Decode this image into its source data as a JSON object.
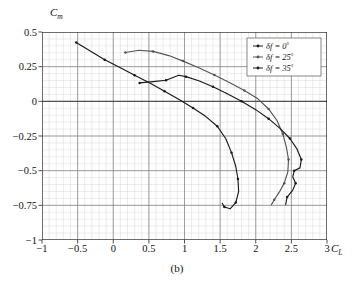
{
  "chart_data": {
    "type": "line",
    "title": "",
    "caption": "(b)",
    "xlabel": "C_L",
    "xlabel_main": "C",
    "xlabel_sub": "L",
    "ylabel": "C_m",
    "ylabel_main": "C",
    "ylabel_sub": "m",
    "xlim": [
      -1,
      3
    ],
    "ylim": [
      -1,
      0.5
    ],
    "xticks": [
      -1,
      -0.5,
      0,
      0.5,
      1,
      1.5,
      2,
      2.5,
      3
    ],
    "xtick_labels": [
      "-1",
      "-0.5",
      "0",
      "0.5",
      "1",
      "1.5",
      "2",
      "2.5",
      "3"
    ],
    "yticks": [
      0.5,
      0.25,
      0,
      -0.25,
      -0.5,
      -0.75,
      -1
    ],
    "ytick_labels": [
      "0.5",
      "0.25",
      "0",
      "-0.25",
      "-0.5",
      "-0.75",
      "-1"
    ],
    "grid": true,
    "grid_major_x": 0.5,
    "grid_major_y": 0.25,
    "grid_minor_x": 0.1,
    "grid_minor_y": 0.05,
    "legend_position": "top-right",
    "series": [
      {
        "name": "df = 0",
        "label_symbol": "δf",
        "label_value": "0",
        "label_unit": "°",
        "color": "#1a1a1a",
        "points": [
          [
            -0.52,
            0.425
          ],
          [
            -0.3,
            0.355
          ],
          [
            -0.12,
            0.3
          ],
          [
            0.1,
            0.243
          ],
          [
            0.3,
            0.188
          ],
          [
            0.52,
            0.13
          ],
          [
            0.72,
            0.072
          ],
          [
            0.93,
            0.012
          ],
          [
            1.12,
            -0.048
          ],
          [
            1.3,
            -0.11
          ],
          [
            1.46,
            -0.18
          ],
          [
            1.58,
            -0.27
          ],
          [
            1.66,
            -0.37
          ],
          [
            1.72,
            -0.47
          ],
          [
            1.75,
            -0.56
          ],
          [
            1.76,
            -0.65
          ],
          [
            1.72,
            -0.73
          ],
          [
            1.64,
            -0.775
          ],
          [
            1.56,
            -0.762
          ],
          [
            1.53,
            -0.735
          ]
        ]
      },
      {
        "name": "df = 25",
        "label_symbol": "δf",
        "label_value": "25",
        "label_unit": "°",
        "color": "#555555",
        "points": [
          [
            0.17,
            0.352
          ],
          [
            0.36,
            0.368
          ],
          [
            0.56,
            0.36
          ],
          [
            0.78,
            0.33
          ],
          [
            0.98,
            0.29
          ],
          [
            1.2,
            0.242
          ],
          [
            1.42,
            0.19
          ],
          [
            1.63,
            0.135
          ],
          [
            1.84,
            0.078
          ],
          [
            2.03,
            0.018
          ],
          [
            2.18,
            -0.055
          ],
          [
            2.3,
            -0.14
          ],
          [
            2.38,
            -0.235
          ],
          [
            2.43,
            -0.33
          ],
          [
            2.46,
            -0.42
          ],
          [
            2.45,
            -0.51
          ],
          [
            2.4,
            -0.59
          ],
          [
            2.33,
            -0.655
          ],
          [
            2.26,
            -0.71
          ],
          [
            2.22,
            -0.745
          ]
        ]
      },
      {
        "name": "df = 35",
        "label_symbol": "δf",
        "label_value": "35",
        "label_unit": "°",
        "color": "#1a1a1a",
        "points": [
          [
            0.37,
            0.133
          ],
          [
            0.56,
            0.142
          ],
          [
            0.74,
            0.152
          ],
          [
            0.92,
            0.188
          ],
          [
            1.02,
            0.178
          ],
          [
            1.2,
            0.148
          ],
          [
            1.4,
            0.105
          ],
          [
            1.6,
            0.055
          ],
          [
            1.8,
            0.0
          ],
          [
            2.0,
            -0.06
          ],
          [
            2.18,
            -0.125
          ],
          [
            2.34,
            -0.195
          ],
          [
            2.48,
            -0.268
          ],
          [
            2.58,
            -0.345
          ],
          [
            2.64,
            -0.42
          ],
          [
            2.62,
            -0.48
          ],
          [
            2.54,
            -0.5
          ],
          [
            2.52,
            -0.545
          ],
          [
            2.56,
            -0.59
          ],
          [
            2.52,
            -0.64
          ],
          [
            2.44,
            -0.69
          ],
          [
            2.42,
            -0.745
          ]
        ]
      }
    ]
  },
  "legend": {
    "items": [
      {
        "symbol": "δf",
        "eq": "=",
        "value": "0",
        "deg": "°"
      },
      {
        "symbol": "δf",
        "eq": "=",
        "value": "25",
        "deg": "°"
      },
      {
        "symbol": "δf",
        "eq": "=",
        "value": "35",
        "deg": "°"
      }
    ]
  }
}
